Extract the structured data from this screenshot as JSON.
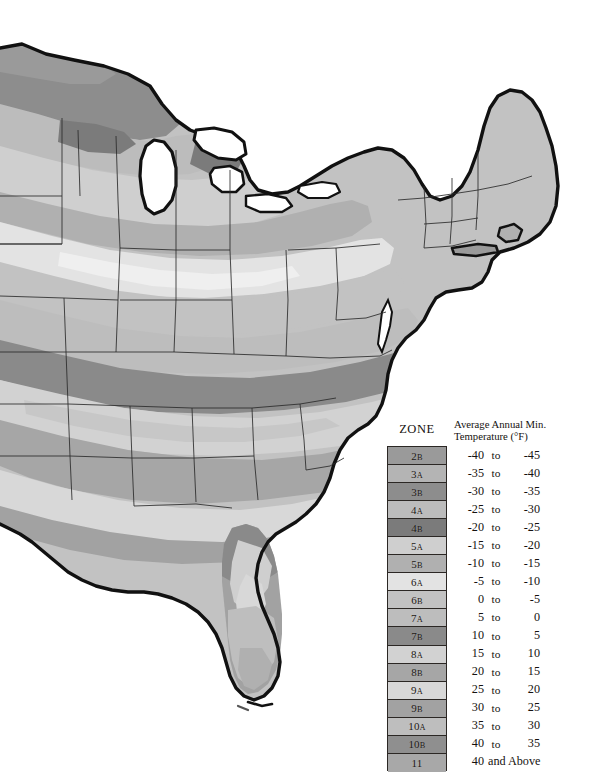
{
  "figure": {
    "region": "Eastern United States",
    "background_color": "#ffffff",
    "outline_color": "#111111"
  },
  "legend": {
    "zone_header": "ZONE",
    "temperature_header_line1": "Average Annual Min.",
    "temperature_header_line2": "Temperature (°F)",
    "rows": [
      {
        "zone_number": "2",
        "zone_letter": "B",
        "zone": "2B",
        "low": "-40",
        "mid": "to",
        "high": "-45",
        "swatch": "#9a9a9a"
      },
      {
        "zone_number": "3",
        "zone_letter": "A",
        "zone": "3A",
        "low": "-35",
        "mid": "to",
        "high": "-40",
        "swatch": "#b4b4b4"
      },
      {
        "zone_number": "3",
        "zone_letter": "B",
        "zone": "3B",
        "low": "-30",
        "mid": "to",
        "high": "-35",
        "swatch": "#8d8d8d"
      },
      {
        "zone_number": "4",
        "zone_letter": "A",
        "zone": "4A",
        "low": "-25",
        "mid": "to",
        "high": "-30",
        "swatch": "#bcbcbc"
      },
      {
        "zone_number": "4",
        "zone_letter": "B",
        "zone": "4B",
        "low": "-20",
        "mid": "to",
        "high": "-25",
        "swatch": "#7b7b7b"
      },
      {
        "zone_number": "5",
        "zone_letter": "A",
        "zone": "5A",
        "low": "-15",
        "mid": "to",
        "high": "-20",
        "swatch": "#cfcfcf"
      },
      {
        "zone_number": "5",
        "zone_letter": "B",
        "zone": "5B",
        "low": "-10",
        "mid": "to",
        "high": "-15",
        "swatch": "#b0b0b0"
      },
      {
        "zone_number": "6",
        "zone_letter": "A",
        "zone": "6A",
        "low": "-5",
        "mid": "to",
        "high": "-10",
        "swatch": "#e3e3e3"
      },
      {
        "zone_number": "6",
        "zone_letter": "B",
        "zone": "6B",
        "low": "0",
        "mid": "to",
        "high": "-5",
        "swatch": "#c2c2c2"
      },
      {
        "zone_number": "7",
        "zone_letter": "A",
        "zone": "7A",
        "low": "5",
        "mid": "to",
        "high": "0",
        "swatch": "#bdbdbd"
      },
      {
        "zone_number": "7",
        "zone_letter": "B",
        "zone": "7B",
        "low": "10",
        "mid": "to",
        "high": "5",
        "swatch": "#8a8a8a"
      },
      {
        "zone_number": "8",
        "zone_letter": "A",
        "zone": "8A",
        "low": "15",
        "mid": "to",
        "high": "10",
        "swatch": "#d2d2d2"
      },
      {
        "zone_number": "8",
        "zone_letter": "B",
        "zone": "8B",
        "low": "20",
        "mid": "to",
        "high": "15",
        "swatch": "#a6a6a6"
      },
      {
        "zone_number": "9",
        "zone_letter": "A",
        "zone": "9A",
        "low": "25",
        "mid": "to",
        "high": "20",
        "swatch": "#d8d8d8"
      },
      {
        "zone_number": "9",
        "zone_letter": "B",
        "zone": "9B",
        "low": "30",
        "mid": "to",
        "high": "25",
        "swatch": "#a2a2a2"
      },
      {
        "zone_number": "10",
        "zone_letter": "A",
        "zone": "10A",
        "low": "35",
        "mid": "to",
        "high": "30",
        "swatch": "#bebebe"
      },
      {
        "zone_number": "10",
        "zone_letter": "B",
        "zone": "10B",
        "low": "40",
        "mid": "to",
        "high": "35",
        "swatch": "#8f8f8f"
      },
      {
        "zone_number": "11",
        "zone_letter": "",
        "zone": "11",
        "low": "40",
        "mid": "and Above",
        "high": "",
        "swatch": "#a8a8a8",
        "wide": true
      }
    ]
  },
  "chart_data": {
    "type": "map",
    "projection": "choropleth of average annual minimum temperature zones",
    "grid": false,
    "legend_position": "bottom-right",
    "categories": [
      "2B",
      "3A",
      "3B",
      "4A",
      "4B",
      "5A",
      "5B",
      "6A",
      "6B",
      "7A",
      "7B",
      "8A",
      "8B",
      "9A",
      "9B",
      "10A",
      "10B",
      "11"
    ],
    "value_ranges_f": [
      [
        -45,
        -40
      ],
      [
        -40,
        -35
      ],
      [
        -35,
        -30
      ],
      [
        -30,
        -25
      ],
      [
        -25,
        -20
      ],
      [
        -20,
        -15
      ],
      [
        -15,
        -10
      ],
      [
        -10,
        -5
      ],
      [
        -5,
        0
      ],
      [
        0,
        5
      ],
      [
        5,
        10
      ],
      [
        10,
        15
      ],
      [
        15,
        20
      ],
      [
        20,
        25
      ],
      [
        25,
        30
      ],
      [
        30,
        35
      ],
      [
        35,
        40
      ],
      [
        40,
        null
      ]
    ],
    "fill_colors": [
      "#9a9a9a",
      "#b4b4b4",
      "#8d8d8d",
      "#bcbcbc",
      "#7b7b7b",
      "#cfcfcf",
      "#b0b0b0",
      "#e3e3e3",
      "#c2c2c2",
      "#bdbdbd",
      "#8a8a8a",
      "#d2d2d2",
      "#a6a6a6",
      "#d8d8d8",
      "#a2a2a2",
      "#bebebe",
      "#8f8f8f",
      "#a8a8a8"
    ],
    "xlabel": "",
    "ylabel": ""
  }
}
